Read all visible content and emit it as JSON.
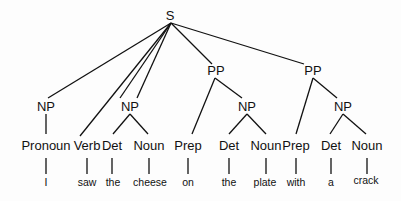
{
  "tree": {
    "root": "S",
    "phrases": {
      "np_subject": "NP",
      "np_object": "NP",
      "pp1": "PP",
      "pp2": "PP",
      "np_pp1": "NP",
      "np_pp2": "NP"
    },
    "pos": [
      "Pronoun",
      "Verb",
      "Det",
      "Noun",
      "Prep",
      "Det",
      "Noun",
      "Prep",
      "Det",
      "Noun"
    ],
    "words": [
      "I",
      "saw",
      "the",
      "cheese",
      "on",
      "the",
      "plate",
      "with",
      "a",
      "crack"
    ]
  }
}
